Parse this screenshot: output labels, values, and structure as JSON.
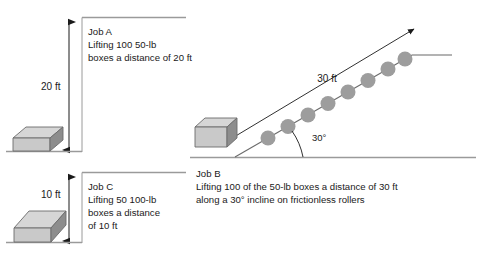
{
  "figure": {
    "background": "#ffffff",
    "ink": "#1a1a1a",
    "rule_color": "#9a9a9a",
    "ground_color": "#9a9a9a",
    "box_top_color": "#d6d6d6",
    "box_front_color": "#c9c9c9",
    "box_side_color": "#8d8d8d",
    "box_edge_color": "#6b6b6b",
    "roller_color": "#9d9d9d"
  },
  "jobs": {
    "a": {
      "id": "job-a",
      "heading": "Job A",
      "line1": "Lifting 100 50-lb",
      "line2": "boxes a distance of 20 ft",
      "dimension_label": "20 ft",
      "dimension_value": 20,
      "dimension_unit": "ft"
    },
    "b": {
      "id": "job-b",
      "heading": "Job B",
      "line1": "Lifting 100 of the 50-lb boxes a distance of 30 ft",
      "line2": "along a 30° incline on frictionless rollers",
      "dimension_label": "30 ft",
      "dimension_value": 30,
      "dimension_unit": "ft",
      "angle_label": "30°",
      "angle_value": 30,
      "roller_count": 8
    },
    "c": {
      "id": "job-c",
      "heading": "Job C",
      "line1": "Lifting 50 100-lb",
      "line2": "boxes a distance",
      "line3": "of 10 ft",
      "dimension_label": "10 ft",
      "dimension_value": 10,
      "dimension_unit": "ft"
    }
  }
}
